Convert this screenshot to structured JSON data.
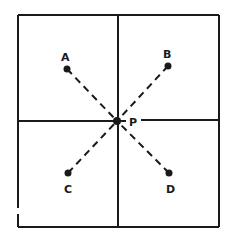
{
  "diagram": {
    "type": "point-grid",
    "colors": {
      "ink": "#1a1a1a",
      "background": "#ffffff"
    },
    "frame": {
      "x1": 18,
      "y1": 15,
      "x2": 219,
      "y2": 227,
      "left_gap": [
        208,
        214
      ]
    },
    "dividers": {
      "vertical_x": 118,
      "horizontal_y": 121
    },
    "center": {
      "label": "P",
      "x": 117,
      "y": 121,
      "label_x": 129,
      "label_y": 126
    },
    "points": [
      {
        "label": "A",
        "x": 67,
        "y": 69,
        "label_x": 61,
        "label_y": 61
      },
      {
        "label": "B",
        "x": 168,
        "y": 66,
        "label_x": 163,
        "label_y": 58
      },
      {
        "label": "C",
        "x": 68,
        "y": 173,
        "label_x": 64,
        "label_y": 193
      },
      {
        "label": "D",
        "x": 169,
        "y": 173,
        "label_x": 166,
        "label_y": 193
      }
    ]
  }
}
